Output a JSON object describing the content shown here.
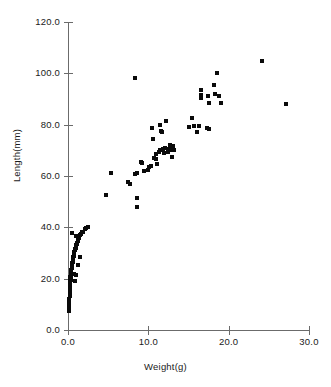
{
  "chart_data": {
    "type": "scatter",
    "title": "",
    "xlabel": "Weight(g)",
    "ylabel": "Length(mm)",
    "xlim": [
      0.0,
      30.0
    ],
    "ylim": [
      0.0,
      120.0
    ],
    "xticks": [
      "0.0",
      "10.0",
      "20.0",
      "30.0"
    ],
    "xtick_values": [
      0.0,
      10.0,
      20.0,
      30.0
    ],
    "yticks": [
      "0.0",
      "20.0",
      "40.0",
      "60.0",
      "80.0",
      "100.0",
      "120.0"
    ],
    "ytick_values": [
      0.0,
      20.0,
      40.0,
      60.0,
      80.0,
      100.0,
      120.0
    ],
    "grid": false,
    "legend": false,
    "marker": "square",
    "marker_color": "#0a0a0a",
    "axis_color": "#6b6b6b",
    "points": [
      [
        0.15,
        7.5
      ],
      [
        0.15,
        9.0
      ],
      [
        0.18,
        10.5
      ],
      [
        0.18,
        12.0
      ],
      [
        0.2,
        13.2
      ],
      [
        0.2,
        14.5
      ],
      [
        0.22,
        15.5
      ],
      [
        0.22,
        16.5
      ],
      [
        0.25,
        17.5
      ],
      [
        0.25,
        18.5
      ],
      [
        0.28,
        19.2
      ],
      [
        0.3,
        19.8
      ],
      [
        0.3,
        20.5
      ],
      [
        0.33,
        21.0
      ],
      [
        0.35,
        21.5
      ],
      [
        0.35,
        22.0
      ],
      [
        0.38,
        22.5
      ],
      [
        0.4,
        23.0
      ],
      [
        0.4,
        23.5
      ],
      [
        0.45,
        24.0
      ],
      [
        0.45,
        24.5
      ],
      [
        0.5,
        25.0
      ],
      [
        0.5,
        25.5
      ],
      [
        0.55,
        26.0
      ],
      [
        0.58,
        26.5
      ],
      [
        0.6,
        27.0
      ],
      [
        0.62,
        27.5
      ],
      [
        0.65,
        28.0
      ],
      [
        0.68,
        28.5
      ],
      [
        0.7,
        29.0
      ],
      [
        0.75,
        29.5
      ],
      [
        0.78,
        30.0
      ],
      [
        0.8,
        30.5
      ],
      [
        0.85,
        31.0
      ],
      [
        0.9,
        31.5
      ],
      [
        0.95,
        32.0
      ],
      [
        1.0,
        32.5
      ],
      [
        1.05,
        33.0
      ],
      [
        1.1,
        33.5
      ],
      [
        1.15,
        34.0
      ],
      [
        1.2,
        34.5
      ],
      [
        1.25,
        35.0
      ],
      [
        1.3,
        35.5
      ],
      [
        1.35,
        36.0
      ],
      [
        1.4,
        36.5
      ],
      [
        1.5,
        37.0
      ],
      [
        1.6,
        37.5
      ],
      [
        1.75,
        38.0
      ],
      [
        1.9,
        38.3
      ],
      [
        2.1,
        39.2
      ],
      [
        2.3,
        39.8
      ],
      [
        2.45,
        40.3
      ],
      [
        0.35,
        19.5
      ],
      [
        0.9,
        19.2
      ],
      [
        0.7,
        22.0
      ],
      [
        1.05,
        21.5
      ],
      [
        1.2,
        25.5
      ],
      [
        1.45,
        28.5
      ],
      [
        0.55,
        37.8
      ],
      [
        1.0,
        36.8
      ],
      [
        4.7,
        52.5
      ],
      [
        5.4,
        61.2
      ],
      [
        7.5,
        57.5
      ],
      [
        7.7,
        57.0
      ],
      [
        8.4,
        60.8
      ],
      [
        8.55,
        61.0
      ],
      [
        8.6,
        51.5
      ],
      [
        8.65,
        48.0
      ],
      [
        8.4,
        98.0
      ],
      [
        9.1,
        65.5
      ],
      [
        9.25,
        65.0
      ],
      [
        9.4,
        62.0
      ],
      [
        9.9,
        62.5
      ],
      [
        10.1,
        63.5
      ],
      [
        10.3,
        64.0
      ],
      [
        10.4,
        78.8
      ],
      [
        10.6,
        74.5
      ],
      [
        10.7,
        67.0
      ],
      [
        10.9,
        66.5
      ],
      [
        11.0,
        68.5
      ],
      [
        11.1,
        64.5
      ],
      [
        11.3,
        69.5
      ],
      [
        11.45,
        70.0
      ],
      [
        11.5,
        79.8
      ],
      [
        11.6,
        77.5
      ],
      [
        11.75,
        77.0
      ],
      [
        11.8,
        70.5
      ],
      [
        11.95,
        69.0
      ],
      [
        12.1,
        71.0
      ],
      [
        12.2,
        81.5
      ],
      [
        12.4,
        69.5
      ],
      [
        12.55,
        70.5
      ],
      [
        12.7,
        72.0
      ],
      [
        12.85,
        70.0
      ],
      [
        13.0,
        67.5
      ],
      [
        13.1,
        71.5
      ],
      [
        13.25,
        70.0
      ],
      [
        15.1,
        79.0
      ],
      [
        15.4,
        82.5
      ],
      [
        15.7,
        79.5
      ],
      [
        16.1,
        77.0
      ],
      [
        16.3,
        79.5
      ],
      [
        16.5,
        93.5
      ],
      [
        16.55,
        91.5
      ],
      [
        16.6,
        90.5
      ],
      [
        17.3,
        78.8
      ],
      [
        17.6,
        78.5
      ],
      [
        17.4,
        91.0
      ],
      [
        17.5,
        88.5
      ],
      [
        18.2,
        95.5
      ],
      [
        18.3,
        92.0
      ],
      [
        18.6,
        100.0
      ],
      [
        18.8,
        91.0
      ],
      [
        19.0,
        88.5
      ],
      [
        24.2,
        104.8
      ],
      [
        27.1,
        88.2
      ]
    ]
  },
  "axes": {
    "x_axis_name": "weight-axis",
    "y_axis_name": "length-axis"
  }
}
